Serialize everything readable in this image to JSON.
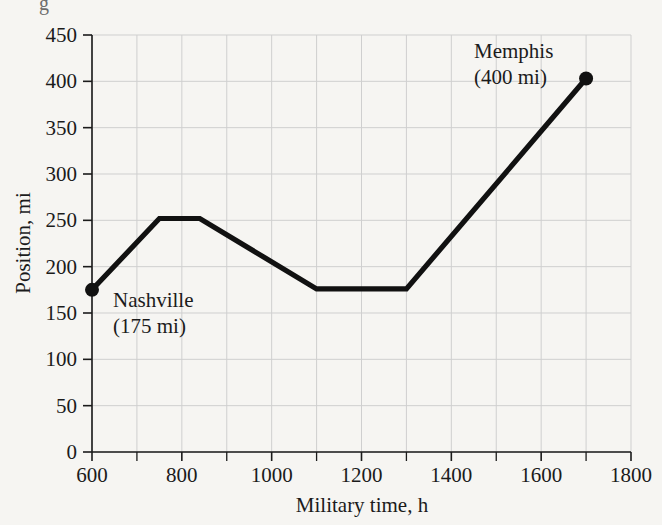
{
  "figure": {
    "background_color": "#f6f5f2",
    "ink_color": "#1b1b1b",
    "grid_color": "#cfcfcf",
    "line_color": "#111111",
    "clipped_top_glyph": "g"
  },
  "chart_data": {
    "type": "line",
    "title": "",
    "xlabel": "Military time, h",
    "ylabel": "Position, mi",
    "xlim": [
      600,
      1800
    ],
    "ylim": [
      0,
      450
    ],
    "xticks": [
      600,
      800,
      1000,
      1200,
      1400,
      1600,
      1800
    ],
    "xtick_labels": [
      "600",
      "800",
      "1000",
      "1200",
      "1400",
      "1600",
      "1800"
    ],
    "x_minor_ticks": [
      700,
      900,
      1100,
      1300,
      1500,
      1700
    ],
    "yticks": [
      0,
      50,
      100,
      150,
      200,
      250,
      300,
      350,
      400,
      450
    ],
    "ytick_labels": [
      "0",
      "50",
      "100",
      "150",
      "200",
      "250",
      "300",
      "350",
      "400",
      "450"
    ],
    "grid": true,
    "grid_x_step": 100,
    "grid_y_step": 50,
    "legend": "none",
    "series": [
      {
        "name": "Position",
        "x": [
          600,
          750,
          840,
          1100,
          1300,
          1700
        ],
        "values": [
          175,
          252,
          252,
          176,
          176,
          403
        ]
      }
    ],
    "markers": [
      {
        "x": 600,
        "y": 175,
        "label": "Nashville",
        "sublabel": "(175 mi)"
      },
      {
        "x": 1700,
        "y": 403,
        "label": "Memphis",
        "sublabel": "(400 mi)"
      }
    ],
    "annotations": [
      {
        "name": "nashville",
        "line1": "Nashville",
        "line2": "(175 mi)",
        "x_px": 113,
        "y_px": 307
      },
      {
        "name": "memphis",
        "line1": "Memphis",
        "line2": "(400 mi)",
        "x_px": 474,
        "y_px": 58
      }
    ]
  },
  "plot_geometry": {
    "left_px": 92,
    "right_px": 631,
    "top_px": 35,
    "bottom_px": 452
  }
}
